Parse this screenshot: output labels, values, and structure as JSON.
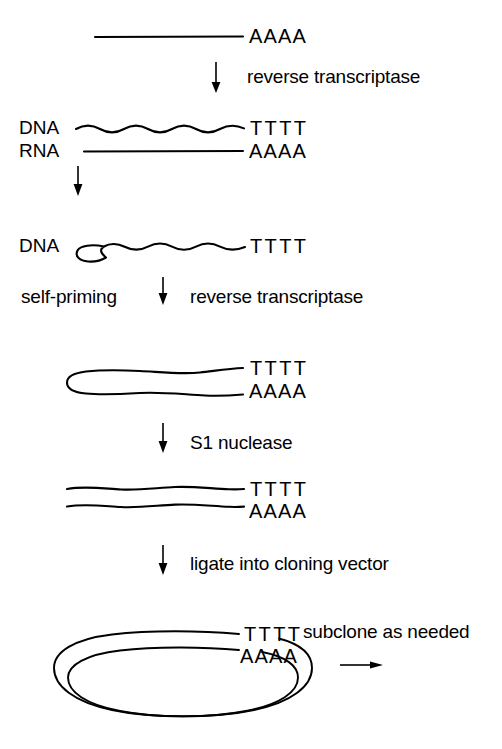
{
  "figure": {
    "background_color": "#ffffff",
    "ink_color": "#000000"
  },
  "steps": [
    {
      "id": "mrna",
      "caption": "",
      "strands": [
        {
          "label": "",
          "type": "rna-straight",
          "tail": "AAAA"
        }
      ]
    },
    {
      "id": "first-strand",
      "caption": "reverse transcriptase",
      "strands": [
        {
          "label": "DNA",
          "type": "dna-wavy",
          "tail": "TTTT"
        },
        {
          "label": "RNA",
          "type": "rna-straight",
          "tail": "AAAA"
        }
      ]
    },
    {
      "id": "single-stranded-cdna",
      "caption": "",
      "strands": [
        {
          "label": "DNA",
          "type": "dna-wavy-hook",
          "tail": "TTTT"
        }
      ]
    },
    {
      "id": "hairpin-duplex",
      "caption_left": "self-priming",
      "caption_right": "reverse transcriptase",
      "strands": [
        {
          "label": "",
          "type": "hairpin-top",
          "tail": "TTTT"
        },
        {
          "label": "",
          "type": "hairpin-bottom",
          "tail": "AAAA"
        }
      ]
    },
    {
      "id": "blunt-duplex",
      "caption": "S1 nuclease",
      "strands": [
        {
          "label": "",
          "type": "wavy",
          "tail": "TTTT"
        },
        {
          "label": "",
          "type": "wavy",
          "tail": "AAAA"
        }
      ]
    },
    {
      "id": "plasmid",
      "caption": "ligate into cloning vector",
      "caption_right": "subclone as needed",
      "strands": [
        {
          "label": "",
          "type": "circle-top",
          "tail": "TTTT"
        },
        {
          "label": "",
          "type": "circle-bottom",
          "tail": "AAAA"
        }
      ]
    }
  ],
  "labels": {
    "aaaa_top": "AAAA",
    "reverse_transcriptase_1": "reverse transcriptase",
    "dna_1": "DNA",
    "tttt_1": "TTTT",
    "rna_1": "RNA",
    "aaaa_1": "AAAA",
    "dna_2": "DNA",
    "tttt_2": "TTTT",
    "self_priming": "self-priming",
    "reverse_transcriptase_2": "reverse transcriptase",
    "tttt_3": "TTTT",
    "aaaa_3": "AAAA",
    "s1_nuclease": "S1 nuclease",
    "tttt_4": "TTTT",
    "aaaa_4": "AAAA",
    "ligate": "ligate into cloning vector",
    "tttt_5": "TTTT",
    "aaaa_5": "AAAA",
    "subclone": "subclone as needed"
  }
}
